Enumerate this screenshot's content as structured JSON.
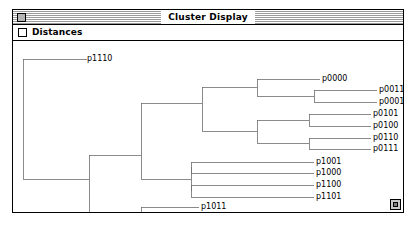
{
  "window": {
    "title": "Cluster Display",
    "close_box": "close-box",
    "grow_box": "grow-box"
  },
  "toolbar": {
    "distances_label": "Distances",
    "distances_checked": false
  },
  "colors": {
    "line": "#6e6e6e",
    "text": "#000000",
    "window_bg": "#ffffff",
    "titlebar_stripe": "#9a9a9a",
    "close_box_fill": "#b4b4b4",
    "grow_box_fill": "#c8c8c8"
  },
  "chart_data": {
    "type": "dendrogram",
    "title": "Cluster Display",
    "orientation": "horizontal-left-root",
    "xlabel": "",
    "ylabel": "",
    "grid": false,
    "legend": false,
    "leaves": [
      {
        "id": "p1110",
        "label": "p1110",
        "x": 74,
        "y": 18
      },
      {
        "id": "p0000",
        "label": "p0000",
        "x": 309,
        "y": 38
      },
      {
        "id": "p0011",
        "label": "p0011",
        "x": 366,
        "y": 49
      },
      {
        "id": "p0001",
        "label": "p0001",
        "x": 366,
        "y": 61
      },
      {
        "id": "p0101",
        "label": "p0101",
        "x": 360,
        "y": 73
      },
      {
        "id": "p0100",
        "label": "p0100",
        "x": 360,
        "y": 85
      },
      {
        "id": "p0110",
        "label": "p0110",
        "x": 360,
        "y": 97
      },
      {
        "id": "p0111",
        "label": "p0111",
        "x": 360,
        "y": 108
      },
      {
        "id": "p1001",
        "label": "p1001",
        "x": 303,
        "y": 121
      },
      {
        "id": "p1000",
        "label": "p1000",
        "x": 303,
        "y": 132
      },
      {
        "id": "p1100",
        "label": "p1100",
        "x": 303,
        "y": 144
      },
      {
        "id": "p1101",
        "label": "p1101",
        "x": 303,
        "y": 156
      },
      {
        "id": "p1011",
        "label": "p1011",
        "x": 188,
        "y": 166
      },
      {
        "id": "p1111",
        "label": "p1111",
        "x": 188,
        "y": 178
      }
    ],
    "merges": [
      {
        "id": "m_0011_0001",
        "x": 301,
        "children_y": [
          49,
          61
        ]
      },
      {
        "id": "m_0000_group",
        "x": 244,
        "children_y": [
          38,
          55
        ]
      },
      {
        "id": "m_0101_0100",
        "x": 296,
        "children_y": [
          73,
          85
        ]
      },
      {
        "id": "m_0110_0111",
        "x": 296,
        "children_y": [
          97,
          108
        ]
      },
      {
        "id": "m_01xx",
        "x": 244,
        "children_y": [
          79,
          102
        ]
      },
      {
        "id": "m_0xxx",
        "x": 189,
        "children_y": [
          46,
          90
        ]
      },
      {
        "id": "m_1001_1000",
        "x": 178,
        "children_y": [
          121,
          132
        ]
      },
      {
        "id": "m_1100_1101",
        "x": 178,
        "children_y": [
          144,
          156
        ]
      },
      {
        "id": "m_10_11xx",
        "x": 128,
        "children_y": [
          126,
          150
        ]
      },
      {
        "id": "m_1011_1111",
        "x": 128,
        "children_y": [
          166,
          178
        ]
      },
      {
        "id": "m_mid",
        "x": 76,
        "children_y": [
          138,
          172
        ]
      },
      {
        "id": "m_root",
        "x": 10,
        "children_y": [
          18,
          138
        ]
      }
    ]
  }
}
